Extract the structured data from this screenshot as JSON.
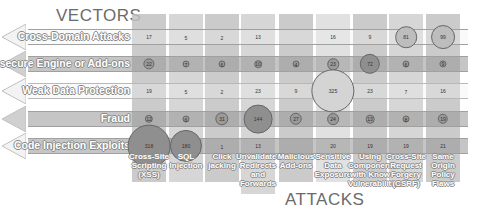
{
  "chart_data": {
    "type": "bubble-matrix",
    "title_y": "VECTORS",
    "title_x": "ATTACKS",
    "rows": [
      "Cross-Domain Attacks",
      "Insecure Engine or Add-ons",
      "Weak Data Protection",
      "Fraud",
      "Code Injection Exploits"
    ],
    "columns": [
      "Cross-Site Scripting (XSS)",
      "SQL Injection",
      "Click jacking",
      "Unvalidated Redirects and Forwards",
      "Malicious Add-ons",
      "Sensitive Data Exposure",
      "Using Components with Know Vulnerabilities",
      "Cross-Site Request Forgery (CSRF)",
      "Same Origin Policy Flaws"
    ],
    "values": [
      [
        17,
        5,
        2,
        13,
        null,
        16,
        9,
        81,
        99
      ],
      [
        22,
        7,
        6,
        10,
        4,
        23,
        72,
        6,
        9
      ],
      [
        19,
        5,
        2,
        23,
        9,
        325,
        23,
        7,
        16
      ],
      [
        12,
        6,
        31,
        144,
        27,
        24,
        13,
        8,
        19
      ],
      [
        318,
        180,
        1,
        13,
        null,
        20,
        19,
        19,
        21
      ]
    ],
    "colors": {
      "band_dark": "#a6a6a6",
      "band_light": "#d9d9d9",
      "bubble_dark": "#8c8c8c",
      "bubble_light": "#c8c8c8",
      "text": "#6b6b6b"
    }
  }
}
